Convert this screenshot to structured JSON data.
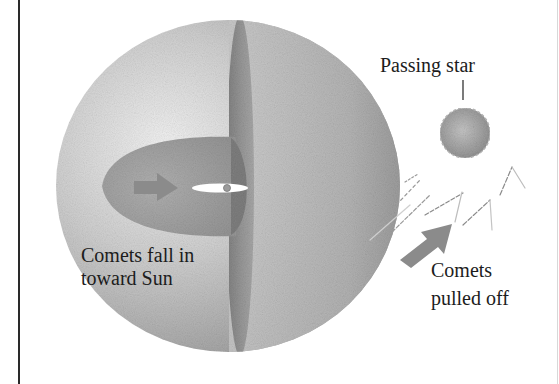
{
  "figure": {
    "type": "diagram",
    "labels": {
      "passing_star": "Passing star",
      "comets_fall_line1": "Comets fall in",
      "comets_fall_line2": "toward Sun",
      "comets_off_line1": "Comets",
      "comets_off_line2": "pulled off"
    },
    "elements": {
      "oort_cloud_sphere": {
        "shape": "sphere",
        "fill": "#a9a9a9"
      },
      "cutaway_band": {
        "shape": "vertical-ellipse-band",
        "fill": "#8a8a8a"
      },
      "inner_cloud": {
        "shape": "ellipse",
        "fill": "#9a9a9a"
      },
      "sun": {
        "shape": "dot",
        "fill": "#888888"
      },
      "planetary_disk": {
        "shape": "thin-ellipse",
        "fill": "#ffffff"
      },
      "passing_star": {
        "shape": "circle",
        "fill": "#9c9c9c"
      },
      "inward_arrow": {
        "direction": "right",
        "fill": "#8c8c8c"
      },
      "outward_arrow": {
        "direction": "up-right",
        "fill": "#8c8c8c"
      }
    },
    "colors": {
      "sphere_light": "#eeeeee",
      "sphere_mid": "#bdbdbd",
      "sphere_dark": "#8f8f8f",
      "arrow": "#8a8a8a",
      "text": "#1c1c1c",
      "frame": "#2a2a2a"
    }
  }
}
